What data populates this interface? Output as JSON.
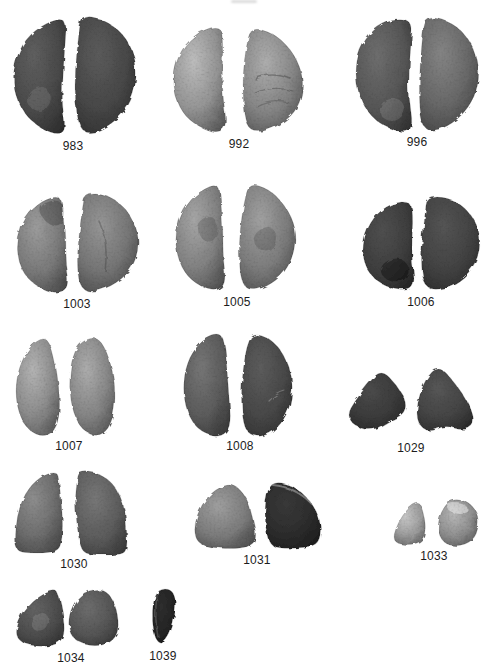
{
  "plate": {
    "background": "#ffffff",
    "label_color": "#1c1c1c",
    "specimen_count": 14,
    "items": [
      {
        "label": "983"
      },
      {
        "label": "992"
      },
      {
        "label": "996"
      },
      {
        "label": "1003"
      },
      {
        "label": "1005"
      },
      {
        "label": "1006"
      },
      {
        "label": "1007"
      },
      {
        "label": "1008"
      },
      {
        "label": "1029"
      },
      {
        "label": "1030"
      },
      {
        "label": "1031"
      },
      {
        "label": "1033"
      },
      {
        "label": "1034"
      },
      {
        "label": "1039"
      }
    ]
  }
}
